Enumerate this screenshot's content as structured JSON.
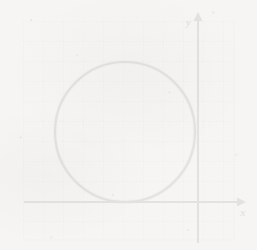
{
  "figure": {
    "background_color": "#f6f5f3",
    "ink_color": "#3a3a3a",
    "grid_color": "#9a9a9a"
  },
  "axes": {
    "x_label": "x",
    "y_label": "y",
    "x_axis_pixel_y": 202,
    "y_axis_pixel_x": 198,
    "x_arrow": "arrow-right",
    "y_arrow": "arrow-up",
    "tick_labels_visible": false
  },
  "grid": {
    "style": "dotted",
    "cell_size_px": 20,
    "left_px": 23,
    "top_px": 21,
    "right_px": 234,
    "bottom_px": 240,
    "columns": 11,
    "rows": 11
  },
  "chart_data": {
    "type": "scatter",
    "xlabel": "x",
    "ylabel": "y",
    "grid": true,
    "legend": "none",
    "xlim": [
      -8.75,
      1.8
    ],
    "ylim": [
      -1.9,
      9.05
    ],
    "unit_px": 20,
    "series": [
      {
        "name": "circle",
        "shape": "circle",
        "center": [
          -3.65,
          3.5
        ],
        "radius": 3.5,
        "center_px": [
          125,
          132
        ],
        "radius_px": 70,
        "stroke": "#3a3a3a",
        "stroke_width_px": 2,
        "fill": "none",
        "tangent_to": "x-axis",
        "tangent_point": [
          -3.65,
          0
        ],
        "tangent_point_px": [
          125,
          202
        ]
      }
    ],
    "annotations": []
  }
}
